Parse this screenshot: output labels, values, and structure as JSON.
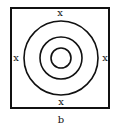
{
  "diagram": {
    "markers": {
      "top": "x",
      "left": "x",
      "right": "x",
      "bottom": "x"
    },
    "caption": "b",
    "rings": 3,
    "stroke_color": "#111111"
  }
}
